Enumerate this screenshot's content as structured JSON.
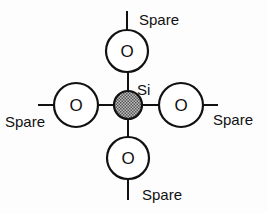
{
  "diagram": {
    "center_atom": {
      "label": "Si",
      "fill": "#8a8a8a"
    },
    "oxygen_atoms": [
      {
        "position": "top",
        "label": "O",
        "spare_label": "Spare"
      },
      {
        "position": "left",
        "label": "O",
        "spare_label": "Spare"
      },
      {
        "position": "right",
        "label": "O",
        "spare_label": "Spare"
      },
      {
        "position": "bottom",
        "label": "O",
        "spare_label": "Spare"
      }
    ],
    "colors": {
      "stroke": "#111111",
      "background": "#fdfdfd"
    }
  }
}
